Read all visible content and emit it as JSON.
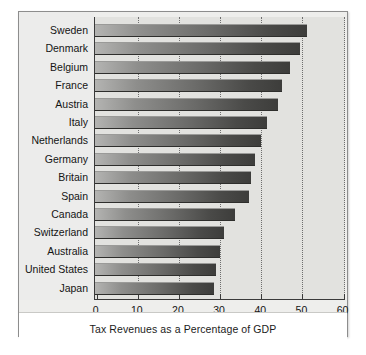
{
  "chart_data": {
    "type": "bar",
    "orientation": "horizontal",
    "title": "",
    "xlabel": "Tax Revenues as a Percentage of GDP",
    "ylabel": "",
    "xlim": [
      0,
      60
    ],
    "xticks": [
      0,
      10,
      20,
      30,
      40,
      50,
      60
    ],
    "xtick_labels": [
      "0",
      "10",
      "20",
      "30",
      "40",
      "50",
      "60"
    ],
    "grid": true,
    "grid_axis": "x",
    "grid_style": "dotted",
    "legend": null,
    "categories": [
      "Sweden",
      "Denmark",
      "Belgium",
      "France",
      "Austria",
      "Italy",
      "Netherlands",
      "Germany",
      "Britain",
      "Spain",
      "Canada",
      "Switzerland",
      "Australia",
      "United States",
      "Japan"
    ],
    "values": [
      51,
      49.5,
      47,
      45,
      44,
      41.5,
      40,
      38.5,
      37.5,
      37,
      33.5,
      31,
      30,
      29,
      28.5
    ],
    "series": [
      {
        "name": "Tax Revenues as a Percentage of GDP",
        "values": [
          51,
          49.5,
          47,
          45,
          44,
          41.5,
          40,
          38.5,
          37.5,
          37,
          33.5,
          31,
          30,
          29,
          28.5
        ]
      }
    ]
  },
  "colors": {
    "bar_light": "#b4b4b2",
    "bar_dark": "#3d3d3b",
    "plot_background": "#e2e2df",
    "label_panel_background": "#ececeb",
    "caption_background": "#ffffff",
    "axis": "#3a3a3a",
    "gridline": "#6e6e6e",
    "text": "#141414"
  }
}
